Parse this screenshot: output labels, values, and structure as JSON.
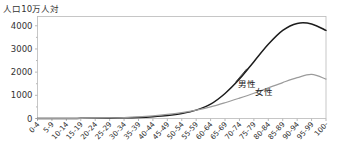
{
  "chart_data": {
    "type": "line",
    "title": "",
    "ylabel": "人口10万人対",
    "xlabel": "",
    "ylim": [
      0,
      4400
    ],
    "yticks": [
      0,
      1000,
      2000,
      3000,
      4000
    ],
    "ytick_labels": [
      "0",
      "1000",
      "2000",
      "3000",
      "4000"
    ],
    "grid": false,
    "legend_position": "inline-annotation",
    "categories": [
      "0-4",
      "5-9",
      "10-14",
      "15-19",
      "20-24",
      "25-29",
      "30-34",
      "35-39",
      "40-44",
      "45-49",
      "50-54",
      "55-59",
      "60-64",
      "65-69",
      "70-74",
      "75-79",
      "80-84",
      "85-89",
      "90-94",
      "95-99",
      "100-"
    ],
    "series": [
      {
        "name": "男性",
        "color": "#1c1c1c",
        "values": [
          2,
          3,
          4,
          6,
          10,
          16,
          28,
          48,
          80,
          130,
          215,
          360,
          620,
          1080,
          1700,
          2450,
          3200,
          3800,
          4100,
          4080,
          3800
        ]
      },
      {
        "name": "女性",
        "color": "#9b9b9b",
        "values": [
          2,
          3,
          4,
          6,
          12,
          22,
          40,
          70,
          115,
          175,
          255,
          360,
          500,
          680,
          880,
          1090,
          1320,
          1550,
          1760,
          1900,
          1700
        ]
      }
    ],
    "annotations": [
      {
        "label": "男性",
        "x_category": "75-79",
        "note": "male-curve-label"
      },
      {
        "label": "女性",
        "x_category": "85-89",
        "note": "female-curve-label"
      }
    ]
  }
}
